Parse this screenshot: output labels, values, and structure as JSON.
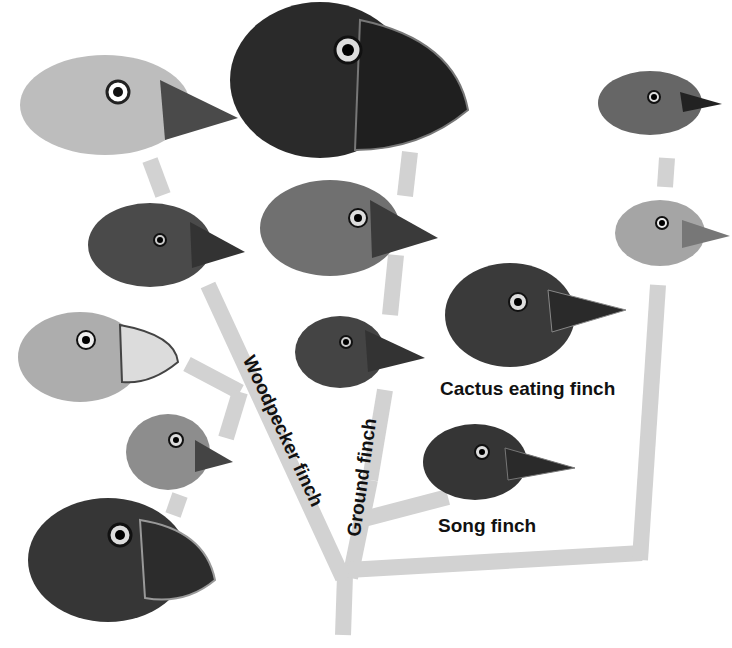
{
  "diagram": {
    "colors": {
      "branch": "#d2d2d2",
      "text": "#111111",
      "background": "#ffffff"
    },
    "labels": {
      "cactus": "Cactus eating finch",
      "song": "Song finch",
      "woodpecker": "Woodpecker finch",
      "ground": "Ground finch"
    },
    "birds": [
      {
        "id": "top-left",
        "x": 20,
        "y": 55,
        "w": 215,
        "h": 110,
        "tone": "#b9b9b9"
      },
      {
        "id": "large-ground",
        "x": 230,
        "y": 2,
        "w": 235,
        "h": 165,
        "tone": "#2e2e2e"
      },
      {
        "id": "top-right-small",
        "x": 595,
        "y": 75,
        "w": 130,
        "h": 70,
        "tone": "#5c5c5c"
      },
      {
        "id": "left-2",
        "x": 90,
        "y": 205,
        "w": 155,
        "h": 90,
        "tone": "#4a4a4a"
      },
      {
        "id": "mid-2",
        "x": 262,
        "y": 178,
        "w": 175,
        "h": 100,
        "tone": "#6a6a6a"
      },
      {
        "id": "right-2",
        "x": 615,
        "y": 200,
        "w": 115,
        "h": 70,
        "tone": "#a0a0a0"
      },
      {
        "id": "cactus",
        "x": 448,
        "y": 262,
        "w": 180,
        "h": 110,
        "tone": "#3a3a3a"
      },
      {
        "id": "left-3",
        "x": 20,
        "y": 310,
        "w": 160,
        "h": 95,
        "tone": "#aaaaaa"
      },
      {
        "id": "mid-3",
        "x": 297,
        "y": 315,
        "w": 128,
        "h": 78,
        "tone": "#444444"
      },
      {
        "id": "left-4",
        "x": 128,
        "y": 413,
        "w": 105,
        "h": 80,
        "tone": "#8a8a8a"
      },
      {
        "id": "song",
        "x": 425,
        "y": 425,
        "w": 150,
        "h": 78,
        "tone": "#333333"
      },
      {
        "id": "bottom-left",
        "x": 30,
        "y": 500,
        "w": 185,
        "h": 130,
        "tone": "#353535"
      }
    ]
  }
}
